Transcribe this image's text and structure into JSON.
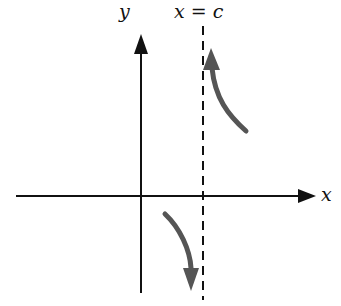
{
  "figure": {
    "labels": {
      "y_axis": "y",
      "x_axis": "x",
      "asymptote": "x = c"
    },
    "colors": {
      "axis": "#111111",
      "asymptote": "#111111",
      "curve": "#555555",
      "background": "#ffffff"
    },
    "elements": {
      "x_axis": {
        "from": [
          16,
          196
        ],
        "to": [
          316,
          196
        ]
      },
      "y_axis": {
        "from": [
          141,
          293
        ],
        "to": [
          141,
          34
        ]
      },
      "asymptote": {
        "x": 203,
        "from_y": 26,
        "to_y": 300,
        "style": "dashed"
      },
      "upper_branch": {
        "direction": "up",
        "approaches": "+infinity",
        "side": "right of c"
      },
      "lower_branch": {
        "direction": "down",
        "approaches": "-infinity",
        "side": "left of c"
      }
    }
  }
}
